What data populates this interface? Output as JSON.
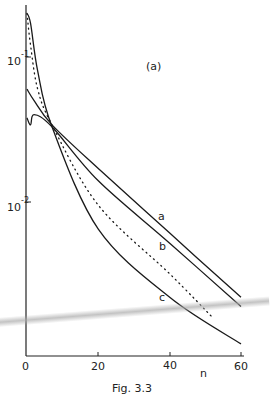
{
  "chart_data": {
    "type": "line",
    "title": "",
    "panel_label": "(a)",
    "caption": "Fig. 3.3",
    "xlabel": "n",
    "ylabel": "",
    "yscale": "log",
    "xlim": [
      0,
      60
    ],
    "ylim": [
      0.001,
      0.25
    ],
    "x_ticks": [
      "0",
      "20",
      "40",
      "60"
    ],
    "y_ticks": [
      {
        "base": "10",
        "exp": "-1",
        "value": 0.1
      },
      {
        "base": "10",
        "exp": "-2",
        "value": 0.01
      }
    ],
    "grid": false,
    "legend": "inline curve labels",
    "series": [
      {
        "name": "a",
        "style": "solid",
        "x": [
          0,
          2,
          7,
          20,
          40,
          60
        ],
        "y": [
          0.06,
          0.05,
          0.034,
          0.017,
          0.0061,
          0.0022
        ]
      },
      {
        "name": "b",
        "style": "solid",
        "x": [
          0,
          1,
          2,
          7,
          20,
          40,
          60
        ],
        "y": [
          0.038,
          0.034,
          0.04,
          0.033,
          0.014,
          0.0052,
          0.0019
        ]
      },
      {
        "name": "c",
        "style": "solid",
        "x": [
          0,
          1,
          3,
          7,
          20,
          40,
          60
        ],
        "y": [
          0.2,
          0.17,
          0.08,
          0.033,
          0.0065,
          0.0022,
          0.00105
        ]
      },
      {
        "name": "dotted",
        "style": "dotted",
        "x": [
          0,
          1,
          3,
          7,
          20,
          40,
          52
        ],
        "y": [
          0.2,
          0.12,
          0.06,
          0.034,
          0.0095,
          0.0032,
          0.0016
        ]
      }
    ]
  },
  "labels": {
    "x0": "0",
    "x20": "20",
    "x40": "40",
    "x60": "60",
    "xname": "n",
    "y1_base": "10",
    "y1_exp": "-1",
    "y2_base": "10",
    "y2_exp": "-2",
    "panel": "(a)",
    "curve_a": "a",
    "curve_b": "b",
    "curve_c": "c",
    "caption": "Fig. 3.3"
  }
}
